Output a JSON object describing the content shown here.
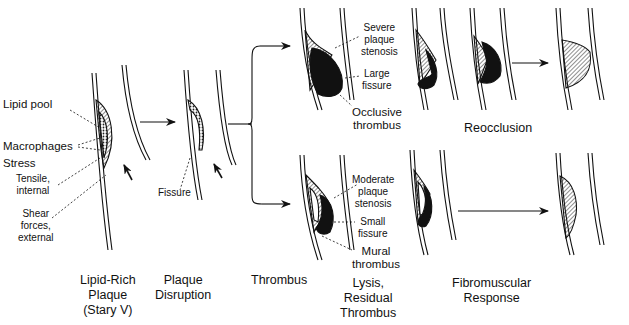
{
  "diagram": {
    "type": "process-flow",
    "stages": [
      {
        "id": "lipid-rich-plaque",
        "label_lines": [
          "Lipid-Rich",
          "Plaque",
          "(Stary V)"
        ]
      },
      {
        "id": "plaque-disruption",
        "label_lines": [
          "Plaque",
          "Disruption"
        ]
      },
      {
        "id": "thrombus",
        "label_lines": [
          "Thrombus"
        ]
      },
      {
        "id": "lysis-residual-thrombus",
        "label_lines": [
          "Lysis,",
          "Residual",
          "Thrombus"
        ]
      },
      {
        "id": "fibromuscular-response",
        "label_lines": [
          "Fibromuscular",
          "Response"
        ]
      }
    ],
    "annotations": {
      "lipid_pool": "Lipid pool",
      "macrophages": "Macrophages",
      "stress": "Stress",
      "tensile": [
        "Tensile,",
        "internal"
      ],
      "shear": [
        "Shear",
        "forces,",
        "external"
      ],
      "fissure": "Fissure",
      "severe_stenosis": [
        "Severe",
        "plaque",
        "stenosis"
      ],
      "large_fissure": [
        "Large",
        "fissure"
      ],
      "occlusive_thrombus": [
        "Occlusive",
        "thrombus"
      ],
      "moderate_stenosis": [
        "Moderate",
        "plaque",
        "stenosis"
      ],
      "small_fissure": [
        "Small",
        "fissure"
      ],
      "mural_thrombus": [
        "Mural",
        "thrombus"
      ],
      "reocclusion": "Reocclusion"
    },
    "branches": [
      {
        "from": "plaque-disruption",
        "to": "thrombus",
        "path": "upper",
        "detail": "severe stenosis, occlusive thrombus"
      },
      {
        "from": "plaque-disruption",
        "to": "thrombus",
        "path": "lower",
        "detail": "moderate stenosis, mural thrombus"
      }
    ],
    "edges": [
      {
        "from": "lipid-rich-plaque",
        "to": "plaque-disruption"
      },
      {
        "from": "thrombus-upper",
        "to": "lysis-upper"
      },
      {
        "from": "lysis-upper",
        "to": "fibromuscular-upper"
      },
      {
        "from": "lysis-lower",
        "to": "fibromuscular-lower"
      }
    ],
    "colors": {
      "ink": "#111111",
      "background": "#ffffff"
    }
  }
}
